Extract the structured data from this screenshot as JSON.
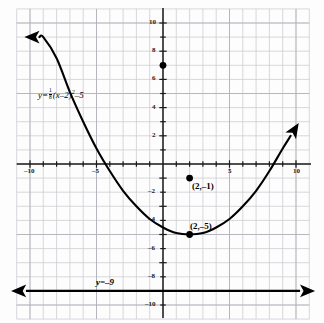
{
  "chart_data": {
    "type": "line",
    "title": "",
    "xlabel": "",
    "ylabel": "",
    "xlim": [
      -10,
      10
    ],
    "ylim": [
      -10,
      10
    ],
    "grid": true,
    "legend_position": "none",
    "x_ticks": [
      -10,
      -5,
      5,
      10
    ],
    "x_tick_labels": [
      "–10",
      "–5",
      "5",
      "10"
    ],
    "y_ticks": [
      10,
      8,
      6,
      4,
      2,
      -2,
      -4,
      -6,
      -8,
      -10
    ],
    "y_tick_labels": [
      "10",
      "8",
      "6",
      "4",
      "2",
      "–2",
      "–4",
      "–6",
      "–8",
      "–10"
    ],
    "series": [
      {
        "name": "parabola",
        "type": "curve",
        "equation": "y = (1/8)(x-2)^2 - 5",
        "vertex": [
          2,
          -5
        ],
        "coefficient_numerator": "1",
        "coefficient_denominator": "8",
        "arrows": "both",
        "x_range": [
          -9.3,
          9.6
        ],
        "points": [
          [
            -9.3,
            9.0
          ],
          [
            -9,
            9.0
          ],
          [
            -8,
            7.5
          ],
          [
            -7,
            5.1
          ],
          [
            -6,
            3.0
          ],
          [
            -5,
            1.1
          ],
          [
            -4,
            -0.5
          ],
          [
            -3,
            -1.9
          ],
          [
            -2,
            -3.0
          ],
          [
            -1,
            -3.9
          ],
          [
            0,
            -4.5
          ],
          [
            1,
            -4.9
          ],
          [
            2,
            -5.0
          ],
          [
            3,
            -4.9
          ],
          [
            4,
            -4.5
          ],
          [
            5,
            -3.9
          ],
          [
            6,
            -3.0
          ],
          [
            7,
            -1.9
          ],
          [
            8,
            -0.5
          ],
          [
            9,
            1.1
          ],
          [
            9.6,
            2.0
          ]
        ]
      },
      {
        "name": "horizontal-line",
        "type": "line",
        "equation": "y = -9",
        "y_value": -9,
        "arrows": "both",
        "x_range": [
          -10,
          10
        ]
      }
    ],
    "annotations": [
      {
        "name": "equation-label",
        "text": "y=",
        "x": -7.6,
        "y": 4.6
      },
      {
        "name": "line-label",
        "text": "y=–9",
        "x": -2.8,
        "y": -8.2
      }
    ],
    "marked_points": [
      {
        "name": "y-intercept-point",
        "x": 0,
        "y": 7,
        "label": "",
        "filled": true
      },
      {
        "name": "point-2-neg1",
        "x": 2,
        "y": -1,
        "label": "(2,–1)",
        "filled": true
      },
      {
        "name": "vertex-point",
        "x": 2,
        "y": -5,
        "label": "(2,–5)",
        "filled": true
      }
    ]
  },
  "labels": {
    "equation_prefix": "y=",
    "equation_num": "1",
    "equation_den": "8",
    "equation_body": "(x–2)",
    "equation_exp": "2",
    "equation_suffix": "–5",
    "line_label": "y=–9",
    "point_a": "(2,–1)",
    "point_b": "(2,–5)"
  },
  "axis_labels": {
    "x_neg10": "–10",
    "x_neg5": "–5",
    "x_5": "5",
    "x_10": "10",
    "y_10": "10",
    "y_8": "8",
    "y_6": "6",
    "y_4": "4",
    "y_2": "2",
    "y_neg2": "–2",
    "y_neg4": "–4",
    "y_neg6": "–6",
    "y_neg8": "–8",
    "y_neg10": "–10"
  },
  "colors": {
    "grid": "#c9c9cf",
    "axis": "#1a1a1a",
    "curve": "#000000",
    "background": "#fdfdfd"
  }
}
